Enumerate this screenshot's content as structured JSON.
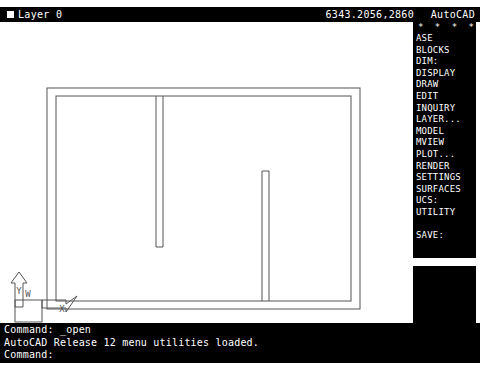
{
  "status_bar": {
    "window_control_icon": "window-box-icon",
    "layer_label": "Layer 0",
    "coordinates": "6343.2056,2860",
    "app_name": "AutoCAD"
  },
  "screen_menu": {
    "stars": "* * * *",
    "items": [
      "ASE",
      "BLOCKS",
      "DIM:",
      "DISPLAY",
      "DRAW",
      "EDIT",
      "INQUIRY",
      "LAYER...",
      "MODEL",
      "MVIEW",
      "PLOT...",
      "RENDER",
      "SETTINGS",
      "SURFACES",
      "UCS:",
      "UTILITY"
    ],
    "save_item": "SAVE:"
  },
  "drawing": {
    "ucs_icon": {
      "y_label": "Y",
      "x_label": "X",
      "world_label": "W"
    },
    "line_color": "#555555",
    "background_color": "#ffffff"
  },
  "command_area": {
    "lines": [
      "Command: _open",
      "AutoCAD Release 12 menu utilities loaded.",
      "Command:"
    ]
  }
}
